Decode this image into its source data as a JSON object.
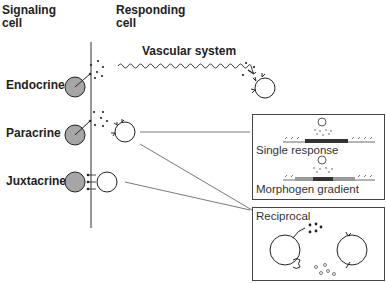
{
  "headers": {
    "signaling": "Signaling\ncell",
    "signaling_line1": "Signaling",
    "signaling_line2": "cell",
    "responding_line1": "Responding",
    "responding_line2": "cell"
  },
  "vascular_label": "Vascular system",
  "modes": [
    {
      "label": "Endocrine"
    },
    {
      "label": "Paracrine"
    },
    {
      "label": "Juxtacrine"
    }
  ],
  "panels": {
    "single_response": "Single response",
    "morphogen_gradient": "Morphogen gradient",
    "reciprocal": "Reciprocal"
  },
  "colors": {
    "signaling_cell_fill": "#a6a6a6",
    "stroke": "#222222",
    "dark_band": "#333333",
    "grad_band": "#888888"
  }
}
